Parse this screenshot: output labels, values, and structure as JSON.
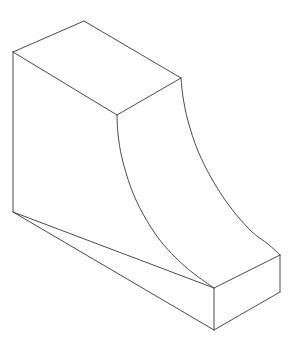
{
  "document": {
    "title": "Isometric Part Drawing",
    "subject": "3d-solid-bracket-with-concave-cove",
    "projection": "isometric",
    "background_color": "#ffffff",
    "line_color": "#4a4a52",
    "line_width_px": 1,
    "canvas": {
      "width": 296,
      "height": 348
    }
  },
  "geometry": {
    "vertices": {
      "top_back_left": [
        13,
        52
      ],
      "top_apex_back": [
        84,
        21
      ],
      "top_right_back": [
        181,
        78
      ],
      "top_front_mid": [
        117,
        115
      ],
      "bottom_left": [
        13,
        212
      ],
      "base_front_top": [
        214,
        288
      ],
      "base_front_bottom": [
        214,
        330
      ],
      "base_right_top": [
        280,
        255
      ],
      "base_right_bottom": [
        280,
        292
      ]
    },
    "edges": [
      {
        "name": "top-face-back-left-edge",
        "type": "line",
        "points": [
          [
            13,
            52
          ],
          [
            84,
            21
          ]
        ]
      },
      {
        "name": "top-face-back-right-edge",
        "type": "line",
        "points": [
          [
            84,
            21
          ],
          [
            181,
            78
          ]
        ]
      },
      {
        "name": "top-face-front-right-edge",
        "type": "line",
        "points": [
          [
            181,
            78
          ],
          [
            117,
            115
          ]
        ]
      },
      {
        "name": "top-face-front-left-edge",
        "type": "line",
        "points": [
          [
            117,
            115
          ],
          [
            13,
            52
          ]
        ]
      },
      {
        "name": "left-vertical-edge",
        "type": "line",
        "points": [
          [
            13,
            52
          ],
          [
            13,
            212
          ]
        ]
      },
      {
        "name": "left-face-bottom-edge",
        "type": "line",
        "points": [
          [
            13,
            212
          ],
          [
            214,
            288
          ]
        ]
      },
      {
        "name": "base-front-bottom-edge",
        "type": "line",
        "points": [
          [
            13,
            212
          ],
          [
            214,
            330
          ]
        ]
      },
      {
        "name": "base-front-vertical-edge",
        "type": "line",
        "points": [
          [
            214,
            288
          ],
          [
            214,
            330
          ]
        ]
      },
      {
        "name": "base-right-front-bottom-edge",
        "type": "line",
        "points": [
          [
            214,
            330
          ],
          [
            280,
            292
          ]
        ]
      },
      {
        "name": "base-right-vertical-edge",
        "type": "line",
        "points": [
          [
            280,
            255
          ],
          [
            280,
            292
          ]
        ]
      },
      {
        "name": "base-right-top-edge",
        "type": "line",
        "points": [
          [
            214,
            288
          ],
          [
            280,
            255
          ]
        ]
      },
      {
        "name": "cove-near-curved-edge",
        "type": "curve",
        "points": [
          [
            117,
            115
          ],
          [
            118,
            134
          ],
          [
            122,
            158
          ],
          [
            131,
            188
          ],
          [
            143,
            214
          ],
          [
            159,
            239
          ],
          [
            176,
            258
          ],
          [
            193,
            273
          ],
          [
            214,
            288
          ]
        ]
      },
      {
        "name": "cove-far-curved-edge",
        "type": "curve",
        "points": [
          [
            181,
            78
          ],
          [
            183,
            97
          ],
          [
            188,
            121
          ],
          [
            198,
            151
          ],
          [
            213,
            181
          ],
          [
            231,
            208
          ],
          [
            251,
            231
          ],
          [
            268,
            244
          ],
          [
            280,
            255
          ]
        ]
      }
    ],
    "faces": [
      {
        "name": "top-face",
        "outline": [
          [
            13,
            52
          ],
          [
            84,
            21
          ],
          [
            181,
            78
          ],
          [
            117,
            115
          ]
        ]
      },
      {
        "name": "left-side-face",
        "outline": [
          [
            13,
            52
          ],
          [
            117,
            115
          ],
          [
            214,
            288
          ],
          [
            214,
            330
          ],
          [
            13,
            212
          ]
        ]
      },
      {
        "name": "base-right-end-face",
        "outline": [
          [
            214,
            288
          ],
          [
            280,
            255
          ],
          [
            280,
            292
          ],
          [
            214,
            330
          ]
        ]
      }
    ]
  }
}
